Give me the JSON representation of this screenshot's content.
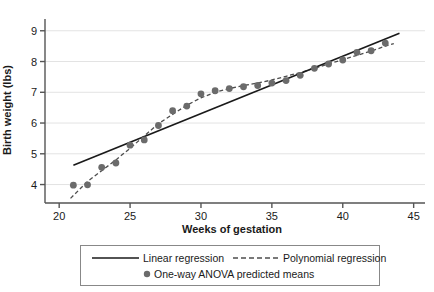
{
  "chart_data": {
    "type": "scatter",
    "title": "",
    "xlabel": "Weeks of gestation",
    "ylabel": "Birth weight (lbs)",
    "xlim": [
      19.0,
      45.8
    ],
    "ylim": [
      3.4,
      9.35
    ],
    "xticks": [
      20,
      25,
      30,
      35,
      40,
      45
    ],
    "yticks": [
      4,
      5,
      6,
      7,
      8,
      9
    ],
    "grid": "horizontal",
    "legend_position": "below-axis",
    "series": [
      {
        "name": "One-way ANOVA predicted means",
        "type": "scatter",
        "marker": "circle",
        "color": "#6b6b6b",
        "x": [
          21,
          22,
          23,
          24,
          25,
          26,
          27,
          28,
          29,
          30,
          31,
          32,
          33,
          34,
          35,
          36,
          37,
          38,
          39,
          40,
          41,
          42,
          43
        ],
        "y": [
          3.98,
          3.99,
          4.56,
          4.7,
          5.28,
          5.45,
          5.92,
          6.4,
          6.55,
          6.95,
          7.05,
          7.12,
          7.18,
          7.22,
          7.3,
          7.38,
          7.55,
          7.78,
          7.92,
          8.05,
          8.3,
          8.35,
          8.6
        ]
      },
      {
        "name": "Linear regression",
        "type": "line",
        "style": "solid",
        "color": "#1a1a1a",
        "x": [
          21,
          44
        ],
        "y": [
          4.63,
          8.92
        ]
      },
      {
        "name": "Polynomial regression",
        "type": "line",
        "style": "dashed",
        "color": "#4d4d4d",
        "x": [
          20.8,
          22,
          23,
          24,
          25,
          26,
          27,
          28,
          29,
          30,
          31,
          32,
          33,
          34,
          35,
          36,
          37,
          38,
          39,
          40,
          41,
          42,
          43,
          43.6
        ],
        "y": [
          3.55,
          4.1,
          4.45,
          4.8,
          5.18,
          5.58,
          5.98,
          6.28,
          6.58,
          6.82,
          7.0,
          7.12,
          7.22,
          7.3,
          7.4,
          7.52,
          7.64,
          7.78,
          7.92,
          8.06,
          8.2,
          8.34,
          8.5,
          8.58
        ]
      }
    ]
  },
  "legend": {
    "items": [
      {
        "label": "Linear regression",
        "marker": "solid-line"
      },
      {
        "label": "Polynomial regression",
        "marker": "dashed-line"
      },
      {
        "label": "One-way ANOVA predicted means",
        "marker": "dot"
      }
    ]
  },
  "colors": {
    "marker": "#6b6b6b",
    "linear_line": "#1a1a1a",
    "poly_line": "#4d4d4d",
    "grid": "#e3e3e3",
    "axis": "#555555",
    "text": "#1a1a1a",
    "legend_border": "#888888",
    "background": "#ffffff"
  }
}
